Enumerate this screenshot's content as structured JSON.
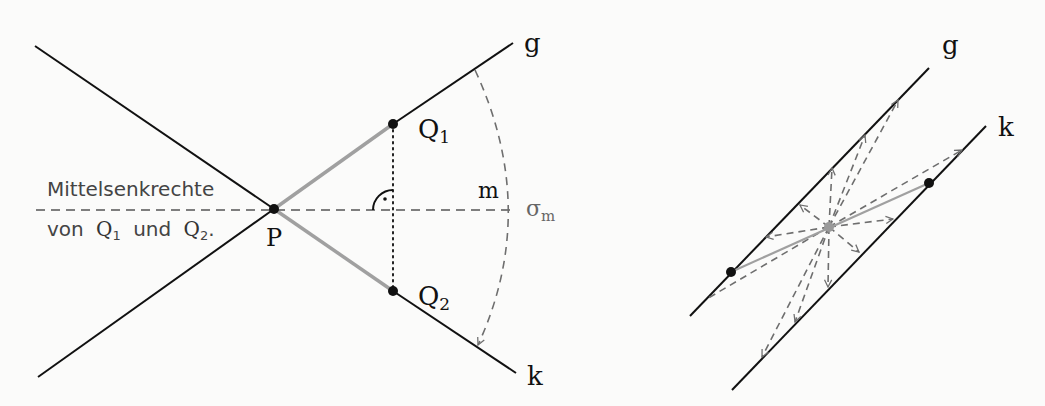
{
  "left_figure": {
    "labels": {
      "perp_bisector_line1": "Mittelsenkrechte",
      "perp_bisector_line2_prefix": "von",
      "perp_bisector_q1": "Q",
      "perp_bisector_q1_sub": "1",
      "perp_bisector_und": "und",
      "perp_bisector_q2": "Q",
      "perp_bisector_q2_sub": "2",
      "perp_bisector_end": ".",
      "point_p": "P",
      "point_q1": "Q",
      "point_q1_sub": "1",
      "point_q2": "Q",
      "point_q2_sub": "2",
      "line_g": "g",
      "line_k": "k",
      "label_m": "m",
      "label_sigma": "σ",
      "label_sigma_sub": "m"
    }
  },
  "right_figure": {
    "labels": {
      "line_g": "g",
      "line_k": "k"
    }
  },
  "colors": {
    "line": "#111111",
    "gray_segment": "#a0a0a0",
    "dashed": "#6e6e6e",
    "text": "#111111",
    "text_gray": "#666666"
  }
}
